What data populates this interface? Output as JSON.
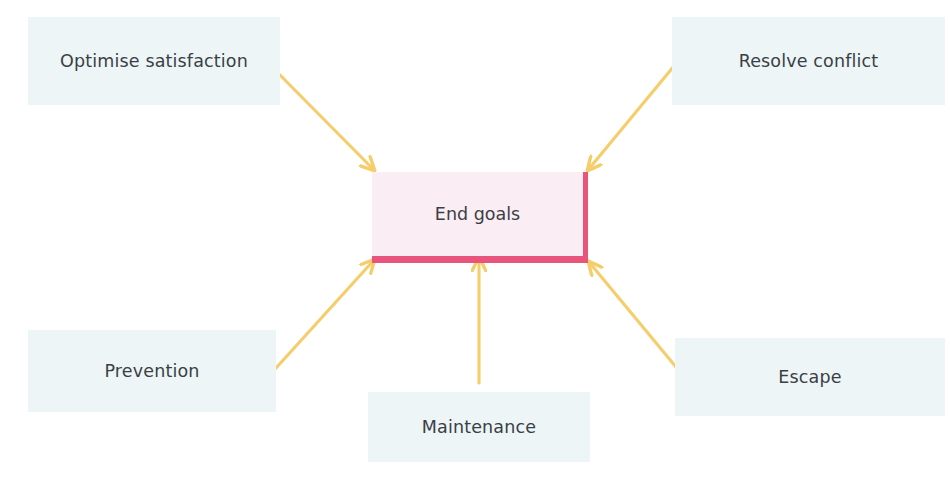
{
  "diagram": {
    "title": "End goals",
    "type": "converging-arrow-diagram",
    "background_color": "#ffffff",
    "center": {
      "label": "End goals",
      "fill_color": "#faedf3",
      "accent_color": "#e8547c",
      "text_color": "#3a3f45"
    },
    "arrow_color": "#f5ce6b",
    "node_fill_color": "#edf5f7",
    "node_text_color": "#3a3f45",
    "nodes": [
      {
        "id": "optimise-satisfaction",
        "label": "Optimise satisfaction",
        "position": "top-left",
        "arrow_direction": "down-right"
      },
      {
        "id": "resolve-conflict",
        "label": "Resolve conflict",
        "position": "top-right",
        "arrow_direction": "down-left"
      },
      {
        "id": "prevention",
        "label": "Prevention",
        "position": "bottom-left",
        "arrow_direction": "up-right"
      },
      {
        "id": "maintenance",
        "label": "Maintenance",
        "position": "bottom-center",
        "arrow_direction": "up"
      },
      {
        "id": "escape",
        "label": "Escape",
        "position": "bottom-right",
        "arrow_direction": "up-left"
      }
    ]
  }
}
